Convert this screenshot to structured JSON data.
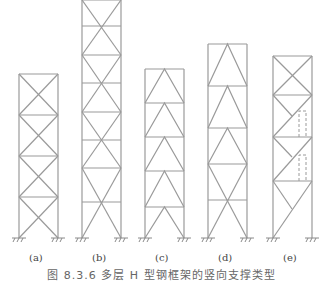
{
  "figure": {
    "caption": "图 8.3.6   多层 H 型钢框架的竖向支撑类型",
    "frames": [
      {
        "id": "a",
        "label": "(a)",
        "type": "X-braced, each storey"
      },
      {
        "id": "b",
        "label": "(b)",
        "type": "X-braced across two storeys (diamond)"
      },
      {
        "id": "c",
        "label": "(c)",
        "type": "Inverted V (chevron) braced"
      },
      {
        "id": "d",
        "label": "(d)",
        "type": "Inverted V upper, X bottom two storeys"
      },
      {
        "id": "e",
        "label": "(e)",
        "type": "Eccentric / mixed bracing with door openings (dashed)"
      }
    ]
  },
  "colors": {
    "line": "#9a9a9a",
    "text": "#444444",
    "background": "#ffffff"
  }
}
